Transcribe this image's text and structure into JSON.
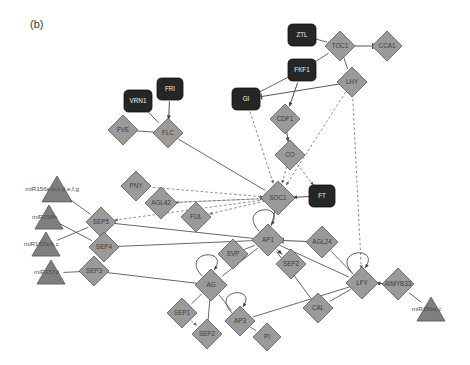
{
  "figure": {
    "panel_label": "(b)",
    "width": 470,
    "height": 365,
    "background": "#ffffff"
  },
  "style": {
    "diamond_fill": "#9a9a9a",
    "diamond_stroke": "#5c5c5c",
    "box_fill": "#262626",
    "box_stroke": "#101010",
    "triangle_fill": "#7f7f7f",
    "triangle_stroke": "#555555",
    "edge_solid": "#4d4d4d",
    "edge_dashed": "#6e6e6e",
    "label_on_dark": "#f2f2f2",
    "label_on_light": "#3b3b3b"
  },
  "chart_data": {
    "type": "network-diagram",
    "node_shapes": {
      "diamond": "gene / transcription factor",
      "rounded-box": "highlighted regulator (dark fill)",
      "triangle": "microRNA"
    },
    "edge_types": {
      "solid-arrow": "activation",
      "solid-bar": "inhibition",
      "dashed-arrow": "indirect / predicted regulation"
    },
    "nodes": [
      {
        "id": "ZTL",
        "label": "ZTL",
        "shape": "box",
        "x": 302,
        "y": 35,
        "w": 28,
        "h": 22
      },
      {
        "id": "TOC1",
        "label": "TOC1",
        "shape": "diamond",
        "x": 340,
        "y": 46,
        "r": 15
      },
      {
        "id": "CCA1",
        "label": "CCA1",
        "shape": "diamond",
        "x": 387,
        "y": 46,
        "r": 15
      },
      {
        "id": "FKF1",
        "label": "FKF1",
        "shape": "box",
        "x": 302,
        "y": 70,
        "w": 28,
        "h": 22
      },
      {
        "id": "LHY",
        "label": "LHY",
        "shape": "diamond",
        "x": 352,
        "y": 82,
        "r": 15
      },
      {
        "id": "FRI",
        "label": "FRI",
        "shape": "box",
        "x": 170,
        "y": 89,
        "w": 26,
        "h": 22
      },
      {
        "id": "VRN1",
        "label": "VRN1",
        "shape": "box",
        "x": 138,
        "y": 101,
        "w": 28,
        "h": 22
      },
      {
        "id": "GI",
        "label": "GI",
        "shape": "box",
        "x": 246,
        "y": 99,
        "w": 28,
        "h": 22
      },
      {
        "id": "FVE",
        "label": "FVE",
        "shape": "diamond",
        "x": 123,
        "y": 130,
        "r": 15
      },
      {
        "id": "FLC",
        "label": "FLC",
        "shape": "diamond",
        "x": 168,
        "y": 133,
        "r": 15
      },
      {
        "id": "CDF1",
        "label": "CDF1",
        "shape": "diamond",
        "x": 285,
        "y": 119,
        "r": 15
      },
      {
        "id": "CO",
        "label": "CO",
        "shape": "diamond",
        "x": 290,
        "y": 155,
        "r": 15
      },
      {
        "id": "PNY",
        "label": "PNY",
        "shape": "diamond",
        "x": 136,
        "y": 186,
        "r": 15
      },
      {
        "id": "AGL42",
        "label": "AGL42",
        "shape": "diamond",
        "x": 161,
        "y": 203,
        "r": 16
      },
      {
        "id": "FUL",
        "label": "FUL",
        "shape": "diamond",
        "x": 196,
        "y": 217,
        "r": 15
      },
      {
        "id": "SOC1",
        "label": "SOC1",
        "shape": "diamond",
        "x": 278,
        "y": 198,
        "r": 17
      },
      {
        "id": "FT",
        "label": "FT",
        "shape": "box",
        "x": 322,
        "y": 196,
        "w": 26,
        "h": 22
      },
      {
        "id": "SEP5",
        "label": "SEP5",
        "shape": "diamond",
        "x": 101,
        "y": 222,
        "r": 15
      },
      {
        "id": "SEP4",
        "label": "SEP4",
        "shape": "diamond",
        "x": 104,
        "y": 247,
        "r": 15
      },
      {
        "id": "SEP3",
        "label": "SEP3",
        "shape": "diamond",
        "x": 94,
        "y": 271,
        "r": 15
      },
      {
        "id": "SVP",
        "label": "SVP",
        "shape": "diamond",
        "x": 233,
        "y": 254,
        "r": 15
      },
      {
        "id": "AP1",
        "label": "AP1",
        "shape": "diamond",
        "x": 268,
        "y": 240,
        "r": 16
      },
      {
        "id": "AGL24",
        "label": "AGL24",
        "shape": "diamond",
        "x": 322,
        "y": 242,
        "r": 16
      },
      {
        "id": "SEP2x",
        "label": "SEP2",
        "shape": "diamond",
        "x": 291,
        "y": 264,
        "r": 15
      },
      {
        "id": "AG",
        "label": "AG",
        "shape": "diamond",
        "x": 211,
        "y": 285,
        "r": 16
      },
      {
        "id": "LFY",
        "label": "LFY",
        "shape": "diamond",
        "x": 362,
        "y": 283,
        "r": 16
      },
      {
        "id": "AtMYB33",
        "label": "AtMYB33",
        "shape": "diamond",
        "x": 398,
        "y": 284,
        "r": 16
      },
      {
        "id": "CAL",
        "label": "CAL",
        "shape": "diamond",
        "x": 318,
        "y": 308,
        "r": 15
      },
      {
        "id": "SEP1",
        "label": "SEP1",
        "shape": "diamond",
        "x": 182,
        "y": 313,
        "r": 15
      },
      {
        "id": "SEP2",
        "label": "SEP2",
        "shape": "diamond",
        "x": 207,
        "y": 334,
        "r": 15
      },
      {
        "id": "AP3",
        "label": "AP3",
        "shape": "diamond",
        "x": 240,
        "y": 321,
        "r": 15
      },
      {
        "id": "PI",
        "label": "PI",
        "shape": "diamond",
        "x": 267,
        "y": 337,
        "r": 14
      },
      {
        "id": "miR156abcdefg",
        "label": "miR156a,b,c,d,e,f,g",
        "shape": "triangle",
        "x": 57,
        "y": 190,
        "r": 14
      },
      {
        "id": "miR156h",
        "label": "miR156h",
        "shape": "triangle",
        "x": 49,
        "y": 218,
        "r": 13
      },
      {
        "id": "miR157abc",
        "label": "miR157a,b,c",
        "shape": "triangle",
        "x": 46,
        "y": 245,
        "r": 13
      },
      {
        "id": "miR157d",
        "label": "miR157d",
        "shape": "triangle",
        "x": 51,
        "y": 273,
        "r": 13
      },
      {
        "id": "miR159ac",
        "label": "miR159a,c",
        "shape": "triangle",
        "x": 431,
        "y": 310,
        "r": 13
      }
    ],
    "edges": [
      {
        "source": "ZTL",
        "target": "TOC1",
        "type": "solid"
      },
      {
        "source": "TOC1",
        "target": "CCA1",
        "type": "inhibit"
      },
      {
        "source": "TOC1",
        "target": "LHY",
        "type": "solid"
      },
      {
        "source": "FKF1",
        "target": "TOC1",
        "type": "solid"
      },
      {
        "source": "FKF1",
        "target": "GI",
        "type": "solid"
      },
      {
        "source": "FKF1",
        "target": "CDF1",
        "type": "arrow"
      },
      {
        "source": "LHY",
        "target": "GI",
        "type": "inhibit"
      },
      {
        "source": "FRI",
        "target": "FLC",
        "type": "arrow"
      },
      {
        "source": "VRN1",
        "target": "FLC",
        "type": "solid"
      },
      {
        "source": "FVE",
        "target": "FLC",
        "type": "solid"
      },
      {
        "source": "CDF1",
        "target": "CO",
        "type": "arrow"
      },
      {
        "source": "CO",
        "target": "SOC1",
        "type": "dashed"
      },
      {
        "source": "CO",
        "target": "FT",
        "type": "dashed"
      },
      {
        "source": "FLC",
        "target": "SOC1",
        "type": "solid"
      },
      {
        "source": "GI",
        "target": "SOC1",
        "type": "dashed"
      },
      {
        "source": "LHY",
        "target": "SOC1",
        "type": "dashed"
      },
      {
        "source": "LHY",
        "target": "LFY",
        "type": "dashed"
      },
      {
        "source": "FT",
        "target": "SOC1",
        "type": "arrow"
      },
      {
        "source": "SOC1",
        "target": "AP1",
        "type": "solid"
      },
      {
        "source": "SOC1",
        "target": "FUL",
        "type": "dashed"
      },
      {
        "source": "SOC1",
        "target": "AGL42",
        "type": "dashed"
      },
      {
        "source": "SOC1",
        "target": "SEP5",
        "type": "dashed"
      },
      {
        "source": "PNY",
        "target": "SOC1",
        "type": "dashed"
      },
      {
        "source": "AGL42",
        "target": "SOC1",
        "type": "dashed"
      },
      {
        "source": "miR156abcdefg",
        "target": "SEP5",
        "type": "solid"
      },
      {
        "source": "miR156h",
        "target": "SEP4",
        "type": "solid"
      },
      {
        "source": "miR157abc",
        "target": "SEP5",
        "type": "solid"
      },
      {
        "source": "miR157d",
        "target": "SEP3",
        "type": "solid"
      },
      {
        "source": "SEP5",
        "target": "AP1",
        "type": "solid"
      },
      {
        "source": "SEP4",
        "target": "AP1",
        "type": "solid"
      },
      {
        "source": "SEP3",
        "target": "AG",
        "type": "solid"
      },
      {
        "source": "SVP",
        "target": "AP1",
        "type": "solid"
      },
      {
        "source": "AP1",
        "target": "SEP2x",
        "type": "arrow"
      },
      {
        "source": "AP1",
        "target": "AG",
        "type": "solid"
      },
      {
        "source": "AP1",
        "target": "LFY",
        "type": "solid"
      },
      {
        "source": "AGL24",
        "target": "AP1",
        "type": "inhibit"
      },
      {
        "source": "AGL24",
        "target": "LFY",
        "type": "solid"
      },
      {
        "source": "AG",
        "target": "AP3",
        "type": "solid"
      },
      {
        "source": "AG",
        "target": "SEP1",
        "type": "solid"
      },
      {
        "source": "AG",
        "target": "SEP2",
        "type": "solid"
      },
      {
        "source": "AP3",
        "target": "PI",
        "type": "solid"
      },
      {
        "source": "SEP1",
        "target": "SEP2",
        "type": "dashed"
      },
      {
        "source": "LFY",
        "target": "CAL",
        "type": "solid"
      },
      {
        "source": "LFY",
        "target": "AP3",
        "type": "solid"
      },
      {
        "source": "CAL",
        "target": "AP1",
        "type": "solid"
      },
      {
        "source": "AtMYB33",
        "target": "LFY",
        "type": "arrow"
      },
      {
        "source": "miR159ac",
        "target": "AtMYB33",
        "type": "solid"
      },
      {
        "source": "AP1",
        "target": "AP1",
        "type": "self"
      },
      {
        "source": "AG",
        "target": "AG",
        "type": "self"
      },
      {
        "source": "AP3",
        "target": "AP3",
        "type": "self"
      },
      {
        "source": "LFY",
        "target": "LFY",
        "type": "self"
      }
    ]
  }
}
